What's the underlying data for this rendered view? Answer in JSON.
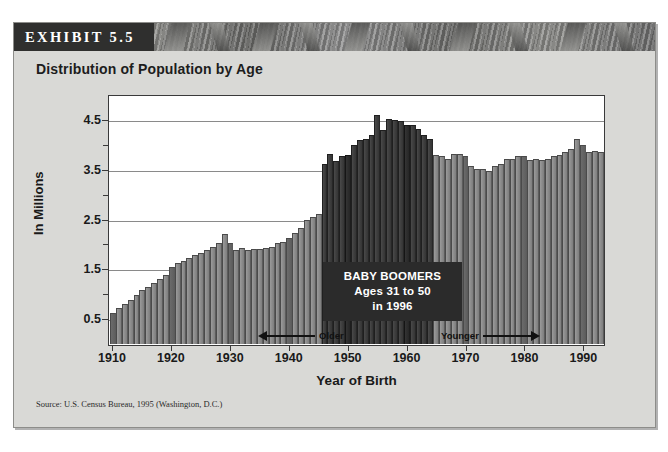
{
  "exhibit": {
    "tag": "EXHIBIT 5.5",
    "title": "Distribution of Population by Age",
    "source": "Source: U.S. Census Bureau, 1995 (Washington, D.C.)"
  },
  "callout": {
    "line1": "BABY BOOMERS",
    "line2": "Ages 31 to 50",
    "line3": "in 1996"
  },
  "annotations": {
    "older": "Older",
    "younger": "Younger"
  },
  "colors": {
    "bar_normal": "#8a8a8a",
    "bar_decade": "#5f5f5f",
    "bar_boom": "#3d3d3d",
    "callout_bg": "#2b2b2b",
    "banner_tag_bg": "#2f2f2e",
    "panel_bg": "#d9d9d6",
    "plot_bg": "#ffffff"
  },
  "chart_data": {
    "type": "bar",
    "title": "Distribution of Population by Age",
    "xlabel": "Year of Birth",
    "ylabel": "In Millions",
    "ylim": [
      0,
      5.0
    ],
    "yticks": [
      0.5,
      1.5,
      2.5,
      3.5,
      4.5
    ],
    "ytick_labels": [
      "0.5",
      "1.5",
      "2.5",
      "3.5",
      "4.5"
    ],
    "yminor_ticks": [
      1.0,
      2.0,
      3.0,
      4.0
    ],
    "grid": true,
    "legend": "none",
    "xticks": [
      1910,
      1920,
      1930,
      1940,
      1950,
      1960,
      1970,
      1980,
      1990
    ],
    "xtick_labels": [
      "1910",
      "1920",
      "1930",
      "1940",
      "1950",
      "1960",
      "1970",
      "1980",
      "1990"
    ],
    "boomer_range": [
      1946,
      1964
    ],
    "categories": [
      1910,
      1911,
      1912,
      1913,
      1914,
      1915,
      1916,
      1917,
      1918,
      1919,
      1920,
      1921,
      1922,
      1923,
      1924,
      1925,
      1926,
      1927,
      1928,
      1929,
      1930,
      1931,
      1932,
      1933,
      1934,
      1935,
      1936,
      1937,
      1938,
      1939,
      1940,
      1941,
      1942,
      1943,
      1944,
      1945,
      1946,
      1947,
      1948,
      1949,
      1950,
      1951,
      1952,
      1953,
      1954,
      1955,
      1956,
      1957,
      1958,
      1959,
      1960,
      1961,
      1962,
      1963,
      1964,
      1965,
      1966,
      1967,
      1968,
      1969,
      1970,
      1971,
      1972,
      1973,
      1974,
      1975,
      1976,
      1977,
      1978,
      1979,
      1980,
      1981,
      1982,
      1983,
      1984,
      1985,
      1986,
      1987,
      1988,
      1989,
      1990,
      1991,
      1992,
      1993
    ],
    "values": [
      0.62,
      0.72,
      0.8,
      0.88,
      0.98,
      1.08,
      1.15,
      1.22,
      1.3,
      1.38,
      1.55,
      1.62,
      1.66,
      1.72,
      1.78,
      1.82,
      1.88,
      1.95,
      2.02,
      2.2,
      2.02,
      1.88,
      1.92,
      1.88,
      1.9,
      1.9,
      1.92,
      1.95,
      2.02,
      2.05,
      2.12,
      2.22,
      2.32,
      2.5,
      2.55,
      2.62,
      3.62,
      3.82,
      3.68,
      3.78,
      3.8,
      4.0,
      4.1,
      4.12,
      4.2,
      4.6,
      4.3,
      4.52,
      4.5,
      4.48,
      4.4,
      4.4,
      4.32,
      4.2,
      4.12,
      3.8,
      3.78,
      3.72,
      3.82,
      3.82,
      3.78,
      3.58,
      3.52,
      3.52,
      3.48,
      3.58,
      3.62,
      3.72,
      3.72,
      3.78,
      3.78,
      3.7,
      3.72,
      3.7,
      3.72,
      3.78,
      3.8,
      3.86,
      3.92,
      4.12,
      4.0,
      3.86,
      3.88,
      3.86
    ]
  }
}
